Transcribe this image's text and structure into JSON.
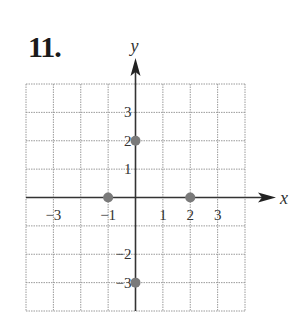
{
  "problem": {
    "number_label": "11."
  },
  "chart_data": {
    "type": "scatter",
    "title": "",
    "xlabel": "x",
    "ylabel": "y",
    "xlim": [
      -4,
      4
    ],
    "ylim": [
      -4,
      4
    ],
    "grid": true,
    "x_tick_labels": [
      {
        "value": -3,
        "label": "−3"
      },
      {
        "value": -1,
        "label": "−1"
      },
      {
        "value": 1,
        "label": "1"
      },
      {
        "value": 2,
        "label": "2"
      },
      {
        "value": 3,
        "label": "3"
      }
    ],
    "y_tick_labels": [
      {
        "value": 3,
        "label": "3"
      },
      {
        "value": 2,
        "label": "2"
      },
      {
        "value": 1,
        "label": "1"
      },
      {
        "value": -2,
        "label": "−2"
      },
      {
        "value": -3,
        "label": "−3"
      }
    ],
    "points": [
      {
        "x": 0,
        "y": 2
      },
      {
        "x": -1,
        "y": 0
      },
      {
        "x": 2,
        "y": 0
      },
      {
        "x": 0,
        "y": -3
      }
    ],
    "colors": {
      "axis": "#333333",
      "grid": "#9a9a9a",
      "point": "#7a7a7a"
    }
  }
}
